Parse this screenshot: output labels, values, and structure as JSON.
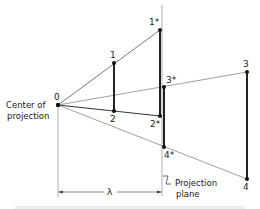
{
  "diagram": {
    "type": "perspective-projection",
    "points": {
      "center": {
        "label": "0",
        "x": 58,
        "y": 105
      },
      "p1": {
        "label": "1",
        "x": 114,
        "y": 63
      },
      "p2": {
        "label": "2",
        "x": 114,
        "y": 111
      },
      "p1s": {
        "label": "1*",
        "x": 160,
        "y": 30
      },
      "p2s": {
        "label": "2*",
        "x": 160,
        "y": 116
      },
      "p3s": {
        "label": "3*",
        "x": 164,
        "y": 87
      },
      "p4s": {
        "label": "4*",
        "x": 164,
        "y": 147
      },
      "p3": {
        "label": "3",
        "x": 247,
        "y": 72
      },
      "p4": {
        "label": "4",
        "x": 247,
        "y": 179
      }
    },
    "labels": {
      "center_line1": "Center of",
      "center_line2": "projection",
      "plane_line1": "Projection",
      "plane_line2": "plane",
      "lambda": "λ",
      "caption": "Figure: perspective projection of two line segments"
    },
    "colors": {
      "line": "#333333",
      "thin_line": "#666666",
      "background": "#ffffff"
    }
  }
}
